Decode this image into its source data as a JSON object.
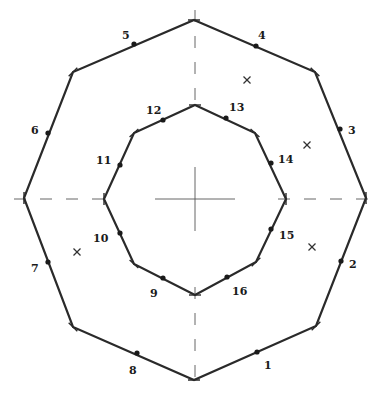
{
  "diagram": {
    "center": [
      195,
      199
    ],
    "outer_octagon": {
      "vertices": [
        [
          194,
          20
        ],
        [
          315,
          72
        ],
        [
          366,
          198
        ],
        [
          316,
          326
        ],
        [
          194,
          380
        ],
        [
          73,
          327
        ],
        [
          24,
          198
        ],
        [
          73,
          72
        ]
      ],
      "nodes": [
        {
          "id": "1",
          "x": 257,
          "y": 352,
          "lx": 264,
          "ly": 369
        },
        {
          "id": "2",
          "x": 341,
          "y": 261,
          "lx": 349,
          "ly": 268
        },
        {
          "id": "3",
          "x": 340,
          "y": 129,
          "lx": 348,
          "ly": 134
        },
        {
          "id": "4",
          "x": 256,
          "y": 46,
          "lx": 258,
          "ly": 39
        },
        {
          "id": "5",
          "x": 134,
          "y": 44,
          "lx": 122,
          "ly": 39
        },
        {
          "id": "6",
          "x": 48,
          "y": 133,
          "lx": 31,
          "ly": 134
        },
        {
          "id": "7",
          "x": 48,
          "y": 262,
          "lx": 31,
          "ly": 272
        },
        {
          "id": "8",
          "x": 137,
          "y": 353,
          "lx": 129,
          "ly": 374
        }
      ]
    },
    "inner_octagon": {
      "vertices": [
        [
          195,
          105
        ],
        [
          255,
          133
        ],
        [
          286,
          199
        ],
        [
          256,
          262
        ],
        [
          195,
          295
        ],
        [
          134,
          264
        ],
        [
          104,
          199
        ],
        [
          134,
          133
        ]
      ],
      "nodes": [
        {
          "id": "9",
          "x": 163,
          "y": 278,
          "lx": 150,
          "ly": 297
        },
        {
          "id": "10",
          "x": 120,
          "y": 233,
          "lx": 93,
          "ly": 242
        },
        {
          "id": "11",
          "x": 120,
          "y": 165,
          "lx": 96,
          "ly": 164
        },
        {
          "id": "12",
          "x": 163,
          "y": 120,
          "lx": 146,
          "ly": 114
        },
        {
          "id": "13",
          "x": 226,
          "y": 118,
          "lx": 229,
          "ly": 111
        },
        {
          "id": "14",
          "x": 271,
          "y": 163,
          "lx": 278,
          "ly": 163
        },
        {
          "id": "15",
          "x": 271,
          "y": 229,
          "lx": 279,
          "ly": 239
        },
        {
          "id": "16",
          "x": 227,
          "y": 277,
          "lx": 232,
          "ly": 295
        }
      ]
    },
    "cross_markers": [
      [
        247,
        80
      ],
      [
        307,
        145
      ],
      [
        312,
        247
      ],
      [
        77,
        252
      ]
    ],
    "axes": {
      "horizontal_y": 199,
      "vertical_x": 195
    }
  }
}
